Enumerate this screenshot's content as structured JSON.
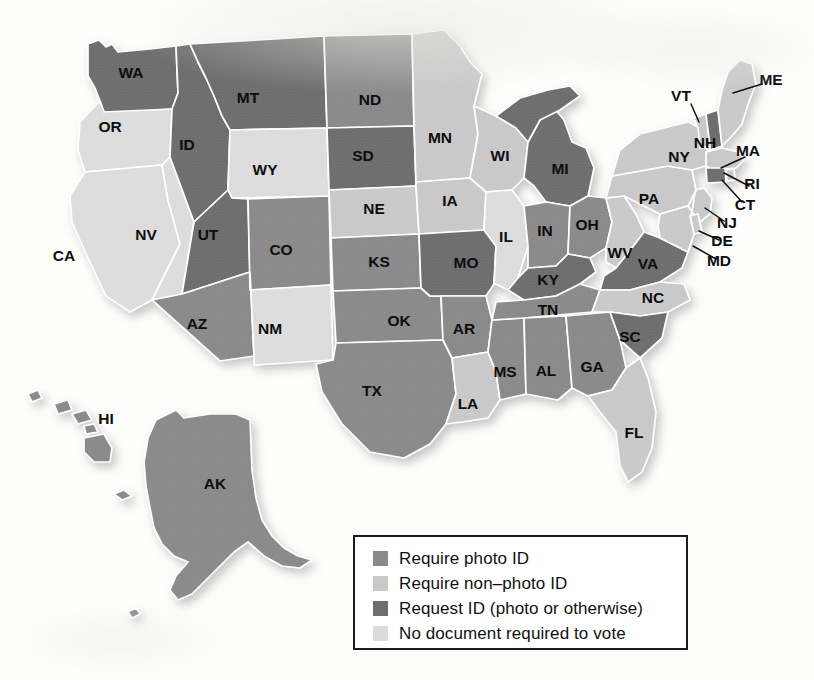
{
  "map": {
    "title": "Voter identification requirements by state",
    "projection": "united-states-albers-with-insets",
    "background_color": "#ffffff",
    "border_color": "#ffffff",
    "legend": {
      "box_border_color": "#1b1b1b",
      "items": [
        {
          "label": "Require photo ID",
          "color": "#8a8a8a",
          "key": "require_photo_id"
        },
        {
          "label": "Require non–photo ID",
          "color": "#c9c9c9",
          "key": "require_non_photo_id"
        },
        {
          "label": "Request ID (photo or otherwise)",
          "color": "#6e6e6e",
          "key": "request_id"
        },
        {
          "label": "No document required to vote",
          "color": "#dcdcdc",
          "key": "no_document_required"
        }
      ]
    },
    "categories": {
      "require_photo_id": "#8a8a8a",
      "require_non_photo_id": "#c9c9c9",
      "request_id": "#6e6e6e",
      "no_document_required": "#dcdcdc"
    },
    "states": [
      {
        "code": "WA",
        "category": "request_id",
        "label_x": 131,
        "label_y": 74
      },
      {
        "code": "OR",
        "category": "no_document_required",
        "label_x": 110,
        "label_y": 128
      },
      {
        "code": "CA",
        "category": "no_document_required",
        "label_x": 64,
        "label_y": 257
      },
      {
        "code": "NV",
        "category": "no_document_required",
        "label_x": 146,
        "label_y": 236
      },
      {
        "code": "ID",
        "category": "request_id",
        "label_x": 187,
        "label_y": 146
      },
      {
        "code": "MT",
        "category": "request_id",
        "label_x": 248,
        "label_y": 99
      },
      {
        "code": "WY",
        "category": "no_document_required",
        "label_x": 265,
        "label_y": 171
      },
      {
        "code": "UT",
        "category": "request_id",
        "label_x": 208,
        "label_y": 236
      },
      {
        "code": "AZ",
        "category": "require_photo_id",
        "label_x": 197,
        "label_y": 325
      },
      {
        "code": "CO",
        "category": "require_photo_id",
        "label_x": 281,
        "label_y": 251
      },
      {
        "code": "NM",
        "category": "no_document_required",
        "label_x": 270,
        "label_y": 330
      },
      {
        "code": "ND",
        "category": "require_photo_id",
        "label_x": 370,
        "label_y": 101
      },
      {
        "code": "SD",
        "category": "request_id",
        "label_x": 363,
        "label_y": 157
      },
      {
        "code": "NE",
        "category": "require_non_photo_id",
        "label_x": 374,
        "label_y": 210
      },
      {
        "code": "KS",
        "category": "require_photo_id",
        "label_x": 379,
        "label_y": 263
      },
      {
        "code": "OK",
        "category": "require_photo_id",
        "label_x": 399,
        "label_y": 322
      },
      {
        "code": "TX",
        "category": "require_photo_id",
        "label_x": 372,
        "label_y": 392
      },
      {
        "code": "MN",
        "category": "require_non_photo_id",
        "label_x": 440,
        "label_y": 139
      },
      {
        "code": "IA",
        "category": "require_non_photo_id",
        "label_x": 450,
        "label_y": 202
      },
      {
        "code": "MO",
        "category": "request_id",
        "label_x": 466,
        "label_y": 264
      },
      {
        "code": "AR",
        "category": "require_photo_id",
        "label_x": 464,
        "label_y": 330
      },
      {
        "code": "LA",
        "category": "require_non_photo_id",
        "label_x": 468,
        "label_y": 405
      },
      {
        "code": "WI",
        "category": "require_non_photo_id",
        "label_x": 500,
        "label_y": 157
      },
      {
        "code": "IL",
        "category": "no_document_required",
        "label_x": 506,
        "label_y": 238
      },
      {
        "code": "MS",
        "category": "require_photo_id",
        "label_x": 505,
        "label_y": 373
      },
      {
        "code": "MI",
        "category": "request_id",
        "label_x": 560,
        "label_y": 170
      },
      {
        "code": "IN",
        "category": "require_photo_id",
        "label_x": 545,
        "label_y": 232
      },
      {
        "code": "KY",
        "category": "request_id",
        "label_x": 548,
        "label_y": 281
      },
      {
        "code": "TN",
        "category": "require_photo_id",
        "label_x": 548,
        "label_y": 311
      },
      {
        "code": "AL",
        "category": "require_photo_id",
        "label_x": 546,
        "label_y": 372
      },
      {
        "code": "OH",
        "category": "require_photo_id",
        "label_x": 587,
        "label_y": 226
      },
      {
        "code": "GA",
        "category": "require_photo_id",
        "label_x": 592,
        "label_y": 368
      },
      {
        "code": "WV",
        "category": "require_non_photo_id",
        "label_x": 620,
        "label_y": 254
      },
      {
        "code": "VA",
        "category": "request_id",
        "label_x": 648,
        "label_y": 265
      },
      {
        "code": "SC",
        "category": "request_id",
        "label_x": 630,
        "label_y": 338
      },
      {
        "code": "NC",
        "category": "require_non_photo_id",
        "label_x": 653,
        "label_y": 299
      },
      {
        "code": "FL",
        "category": "require_non_photo_id",
        "label_x": 634,
        "label_y": 434
      },
      {
        "code": "PA",
        "category": "require_non_photo_id",
        "label_x": 649,
        "label_y": 200
      },
      {
        "code": "NY",
        "category": "require_non_photo_id",
        "label_x": 679,
        "label_y": 158
      },
      {
        "code": "HI",
        "category": "require_photo_id",
        "label_x": 106,
        "label_y": 420
      },
      {
        "code": "AK",
        "category": "require_photo_id",
        "label_x": 215,
        "label_y": 485
      }
    ],
    "callout_states": [
      {
        "code": "ME",
        "category": "require_non_photo_id",
        "label_x": 771,
        "label_y": 81,
        "line": [
          762,
          84,
          733,
          93
        ]
      },
      {
        "code": "VT",
        "category": "require_non_photo_id",
        "label_x": 681,
        "label_y": 97,
        "line": [
          691,
          104,
          699,
          122
        ]
      },
      {
        "code": "NH",
        "category": "request_id",
        "label_x": 705,
        "label_y": 144,
        "line": null
      },
      {
        "code": "MA",
        "category": "require_non_photo_id",
        "label_x": 748,
        "label_y": 152,
        "line": [
          745,
          157,
          721,
          168
        ]
      },
      {
        "code": "RI",
        "category": "require_non_photo_id",
        "label_x": 752,
        "label_y": 185,
        "line": [
          749,
          186,
          724,
          173
        ]
      },
      {
        "code": "CT",
        "category": "request_id",
        "label_x": 745,
        "label_y": 206,
        "line": [
          742,
          202,
          722,
          180
        ]
      },
      {
        "code": "NJ",
        "category": "require_non_photo_id",
        "label_x": 727,
        "label_y": 224,
        "line": [
          724,
          221,
          705,
          208
        ]
      },
      {
        "code": "DE",
        "category": "require_non_photo_id",
        "label_x": 722,
        "label_y": 242,
        "line": [
          719,
          240,
          699,
          231
        ]
      },
      {
        "code": "MD",
        "category": "require_non_photo_id",
        "label_x": 719,
        "label_y": 262,
        "line": [
          716,
          259,
          693,
          246
        ]
      }
    ]
  }
}
